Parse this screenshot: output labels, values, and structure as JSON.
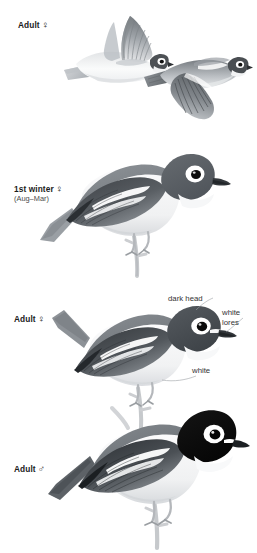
{
  "plate": {
    "background_color": "#ffffff",
    "width": 257,
    "height": 553,
    "subject": "vireo-species-plate",
    "style": "field-guide-illustration-grayscale"
  },
  "figures": [
    {
      "id": "flight-upper-left",
      "pose": "in-flight-wings-raised",
      "view": "side",
      "label_ref": "adult-female-flight"
    },
    {
      "id": "flight-upper-right",
      "pose": "in-flight-wings-lowered",
      "view": "side",
      "label_ref": "adult-female-flight"
    },
    {
      "id": "perched-first-winter",
      "pose": "perched-on-branch",
      "view": "side",
      "label_ref": "first-winter-female"
    },
    {
      "id": "perched-adult-female",
      "pose": "perched-on-branch",
      "view": "side",
      "label_ref": "adult-female-perched"
    },
    {
      "id": "perched-adult-male",
      "pose": "perched-on-branch",
      "view": "side",
      "label_ref": "adult-male-perched"
    }
  ],
  "labels": {
    "adult_female_flight": {
      "text": "Adult",
      "symbol": "♀"
    },
    "first_winter_female": {
      "text": "1st winter",
      "symbol": "♀",
      "months": "(Aug–Mar)"
    },
    "adult_female_perched": {
      "text": "Adult",
      "symbol": "♀"
    },
    "adult_male_perched": {
      "text": "Adult",
      "symbol": "♂"
    }
  },
  "annotations": {
    "dark_head": "dark head",
    "white_lores_line1": "white",
    "white_lores_line2": "lores",
    "white_underparts": "white"
  },
  "colors": {
    "ink": "#1b1b1b",
    "annotation_text": "#333333",
    "sublabel_text": "#4a4a4a",
    "head_dark": "#6e7276",
    "head_black": "#121212",
    "upperparts": "#8b9095",
    "wing_dark": "#3a3d41",
    "underparts": "#f4f5f6",
    "flank_wash": "#d8dade",
    "branch": "#c9cbce",
    "eye_ring_white": "#ffffff"
  }
}
